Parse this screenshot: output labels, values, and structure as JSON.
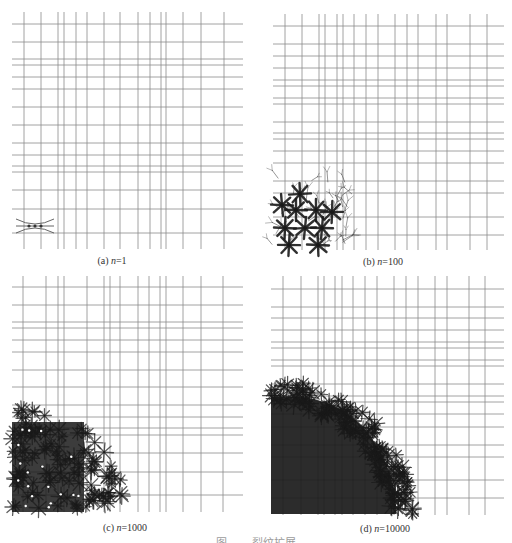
{
  "figure": {
    "caption_partial": "图　　 裂纹扩展",
    "line_color": "#8c8c8c",
    "crack_color": "#1a1a1a",
    "panels": [
      {
        "id": "a",
        "label_prefix": "(a) ",
        "label_var": "n",
        "label_value": "=1",
        "n": 1,
        "caption_x": 112,
        "caption_y": 255,
        "vlines": [
          24,
          41,
          58,
          64,
          76,
          87,
          104,
          120,
          138,
          150,
          161,
          166,
          183,
          201,
          224
        ],
        "v_range": [
          12,
          249
        ],
        "hlines": [
          24,
          42,
          59,
          65,
          77,
          89,
          107,
          125,
          143,
          155,
          166,
          172,
          190,
          209,
          233
        ],
        "h_range": [
          12,
          243
        ],
        "cluster": {
          "type": "seed",
          "cx": 35,
          "cy": 226,
          "half_len": 19
        }
      },
      {
        "id": "b",
        "label_prefix": "(b) ",
        "label_var": "n",
        "label_value": "=100",
        "n": 100,
        "caption_x": 383,
        "caption_y": 256,
        "vlines": [
          285,
          302,
          319,
          325,
          337,
          343,
          354,
          366,
          378,
          395,
          407,
          418,
          436,
          447,
          470,
          487
        ],
        "v_range": [
          14,
          250
        ],
        "hlines": [
          26,
          44,
          56,
          68,
          80,
          86,
          98,
          104,
          122,
          133,
          139,
          151,
          163,
          181,
          193,
          217,
          235
        ],
        "h_range": [
          273,
          504
        ],
        "cluster": {
          "type": "stars",
          "x0": 272,
          "y0": 178,
          "x1": 352,
          "y1": 250,
          "centers": [
            [
              285,
              228
            ],
            [
              305,
              228
            ],
            [
              322,
              228
            ],
            [
              296,
              210
            ],
            [
              316,
              210
            ],
            [
              332,
              212
            ],
            [
              289,
              245
            ],
            [
              318,
              245
            ],
            [
              300,
              194
            ],
            [
              282,
              205
            ]
          ]
        }
      },
      {
        "id": "c",
        "label_prefix": "(c) ",
        "label_var": "n",
        "label_value": "=1000",
        "n": 1000,
        "caption_x": 125,
        "caption_y": 522,
        "vlines": [
          23,
          46,
          58,
          64,
          87,
          104,
          110,
          120,
          138,
          149,
          160,
          166,
          183,
          201,
          223
        ],
        "v_range": [
          276,
          512
        ],
        "hlines": [
          287,
          305,
          322,
          328,
          340,
          352,
          370,
          387,
          405,
          417,
          428,
          435,
          453,
          472,
          495
        ],
        "h_range": [
          12,
          243
        ],
        "cluster": {
          "type": "blob",
          "x0": 12,
          "y0": 408,
          "x1": 124,
          "y1": 512,
          "dense_x1": 84,
          "dense_y0": 422
        }
      },
      {
        "id": "d",
        "label_prefix": "(d) ",
        "label_var": "n",
        "label_value": "=10000",
        "n": 10000,
        "caption_x": 385,
        "caption_y": 523,
        "vlines": [
          283,
          301,
          318,
          324,
          335,
          342,
          353,
          365,
          377,
          394,
          406,
          418,
          435,
          447,
          469,
          485
        ],
        "v_range": [
          276,
          515
        ],
        "hlines": [
          289,
          307,
          318,
          330,
          342,
          348,
          360,
          366,
          384,
          396,
          402,
          414,
          427,
          445,
          457,
          480,
          498
        ],
        "h_range": [
          271,
          504
        ],
        "cluster": {
          "type": "quarter",
          "x0": 271,
          "y0": 385,
          "x1": 406,
          "y1": 514,
          "dense_x1": 356,
          "dense_y0": 400
        }
      }
    ]
  }
}
